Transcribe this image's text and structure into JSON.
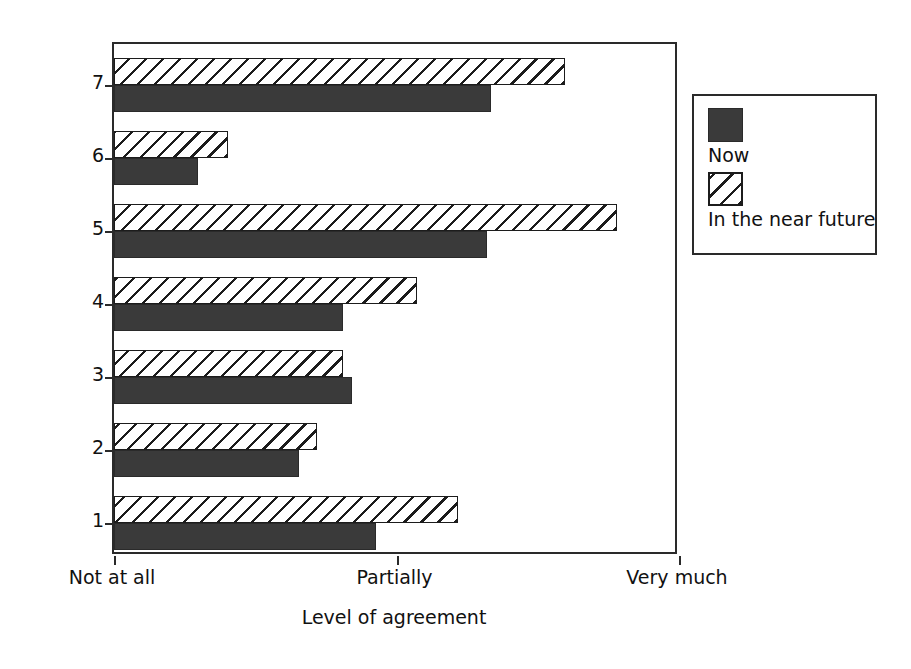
{
  "chart_data": {
    "type": "bar",
    "orientation": "horizontal",
    "title": "",
    "xlabel": "Level of agreement",
    "ylabel": "Characteristics",
    "categories": [
      "1",
      "2",
      "3",
      "4",
      "5",
      "6",
      "7"
    ],
    "xlim": [
      0,
      1
    ],
    "xtick_values": [
      0,
      0.5,
      1
    ],
    "xtick_labels": [
      "Not at all",
      "Partially",
      "Very much"
    ],
    "grid": false,
    "legend_position": "right-top",
    "series": [
      {
        "name": "Now",
        "style": "solid-dark-fill",
        "color": "#3a3a3a",
        "values": [
          0.463,
          0.328,
          0.422,
          0.406,
          0.661,
          0.149,
          0.668
        ]
      },
      {
        "name": "In the near future",
        "style": "diagonal-hatch",
        "color": "#ffffff",
        "values": [
          0.608,
          0.36,
          0.406,
          0.537,
          0.89,
          0.202,
          0.799
        ]
      }
    ]
  },
  "legend": {
    "items": [
      {
        "label": "Now",
        "swatch": "solid-dark-swatch"
      },
      {
        "label": "In the near future",
        "swatch": "hatched-swatch"
      }
    ]
  },
  "axes": {
    "y_title": "Characteristics",
    "x_title": "Level of agreement",
    "y_tick_labels": [
      "1",
      "2",
      "3",
      "4",
      "5",
      "6",
      "7"
    ],
    "x_tick_labels": [
      "Not at all",
      "Partially",
      "Very much"
    ]
  },
  "colors": {
    "now_fill": "#3a3a3a",
    "hatch_stroke": "#1c1c1c",
    "axis": "#2a2a2a",
    "background": "#ffffff"
  }
}
